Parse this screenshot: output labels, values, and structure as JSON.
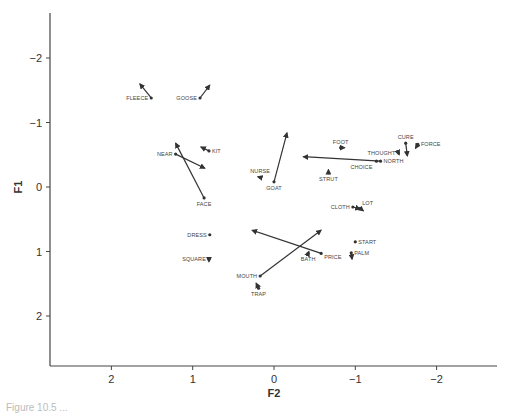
{
  "chart_data": {
    "type": "scatter",
    "subtype": "biplot-with-arrows",
    "title": "",
    "xlabel": "F2",
    "ylabel": "F1",
    "x_reversed": true,
    "y_reversed": true,
    "xlim": [
      2.8,
      -2.75
    ],
    "ylim": [
      -2.7,
      2.75
    ],
    "xticks": [
      2,
      1,
      0,
      -1,
      -2
    ],
    "xtick_labels": [
      "2",
      "1",
      "0",
      "−1",
      "−2"
    ],
    "yticks": [
      -2,
      -1,
      0,
      1,
      2
    ],
    "ytick_labels": [
      "−2",
      "−1",
      "0",
      "1",
      "2"
    ],
    "grid": false,
    "legend": null,
    "points": [
      {
        "label": "FLEECE",
        "f2": 1.51,
        "f1": -1.38,
        "arrow_to": {
          "f2": 1.65,
          "f1": -1.6
        },
        "label_side": "left"
      },
      {
        "label": "GOOSE",
        "f2": 0.91,
        "f1": -1.38,
        "arrow_to": {
          "f2": 0.79,
          "f1": -1.58
        },
        "label_side": "left"
      },
      {
        "label": "KIT",
        "f2": 0.8,
        "f1": -0.56,
        "arrow_to": {
          "f2": 0.9,
          "f1": -0.62
        },
        "label_side": "right"
      },
      {
        "label": "NEAR",
        "f2": 1.21,
        "f1": -0.51,
        "arrow_to": {
          "f2": 0.85,
          "f1": -0.29
        },
        "label_side": "left"
      },
      {
        "label": "FACE",
        "f2": 0.86,
        "f1": 0.17,
        "arrow_to": {
          "f2": 1.21,
          "f1": -0.68
        },
        "label_side": "below"
      },
      {
        "label": "NURSE",
        "f2": 0.17,
        "f1": -0.15,
        "arrow_to": {
          "f2": 0.2,
          "f1": -0.16
        },
        "label_side": "above"
      },
      {
        "label": "GOAT",
        "f2": 0.0,
        "f1": -0.08,
        "arrow_to": {
          "f2": -0.16,
          "f1": -0.84
        },
        "label_side": "below"
      },
      {
        "label": "FOOT",
        "f2": -0.82,
        "f1": -0.61,
        "arrow_to": {
          "f2": -0.87,
          "f1": -0.61
        },
        "label_side": "above"
      },
      {
        "label": "STRUT",
        "f2": -0.67,
        "f1": -0.22,
        "arrow_to": {
          "f2": -0.67,
          "f1": -0.27
        },
        "label_side": "below"
      },
      {
        "label": "NORTH",
        "f2": -1.31,
        "f1": -0.4,
        "arrow_to": {
          "f2": -0.36,
          "f1": -0.47
        },
        "label_side": "right"
      },
      {
        "label": "CHOICE",
        "f2": -1.26,
        "f1": -0.4,
        "arrow_to": null,
        "label_side": "below-left"
      },
      {
        "label": "THOUGHT",
        "f2": -1.53,
        "f1": -0.53,
        "arrow_to": {
          "f2": -1.54,
          "f1": -0.5
        },
        "label_side": "left"
      },
      {
        "label": "CURE",
        "f2": -1.62,
        "f1": -0.68,
        "arrow_to": {
          "f2": -1.64,
          "f1": -0.48
        },
        "label_side": "above"
      },
      {
        "label": "FORCE",
        "f2": -1.77,
        "f1": -0.66,
        "arrow_to": {
          "f2": -1.74,
          "f1": -0.6
        },
        "label_side": "right"
      },
      {
        "label": "CLOTH",
        "f2": -0.97,
        "f1": 0.31,
        "arrow_to": {
          "f2": -1.06,
          "f1": 0.34
        },
        "label_side": "left"
      },
      {
        "label": "LOT",
        "f2": -1.06,
        "f1": 0.33,
        "arrow_to": {
          "f2": -1.1,
          "f1": 0.37
        },
        "label_side": "above-right"
      },
      {
        "label": "DRESS",
        "f2": 0.79,
        "f1": 0.74,
        "arrow_to": null,
        "label_side": "left"
      },
      {
        "label": "SQUARE",
        "f2": 0.8,
        "f1": 1.12,
        "arrow_to": {
          "f2": 0.8,
          "f1": 1.16
        },
        "label_side": "left"
      },
      {
        "label": "PRICE",
        "f2": -0.58,
        "f1": 1.03,
        "arrow_to": {
          "f2": 0.27,
          "f1": 0.67
        },
        "label_side": "right-below"
      },
      {
        "label": "MOUTH",
        "f2": 0.17,
        "f1": 1.38,
        "arrow_to": {
          "f2": -0.58,
          "f1": 0.67
        },
        "label_side": "left"
      },
      {
        "label": "BATH",
        "f2": -0.42,
        "f1": 1.03,
        "arrow_to": {
          "f2": -0.43,
          "f1": 1.0
        },
        "label_side": "below"
      },
      {
        "label": "START",
        "f2": -1.0,
        "f1": 0.85,
        "arrow_to": null,
        "label_side": "right"
      },
      {
        "label": "PALM",
        "f2": -0.95,
        "f1": 1.02,
        "arrow_to": {
          "f2": -0.96,
          "f1": 1.12
        },
        "label_side": "right"
      },
      {
        "label": "TRAP",
        "f2": 0.19,
        "f1": 1.57,
        "arrow_to": {
          "f2": 0.22,
          "f1": 1.49
        },
        "label_side": "below"
      }
    ]
  },
  "caption": "Figure 10.5 ..."
}
